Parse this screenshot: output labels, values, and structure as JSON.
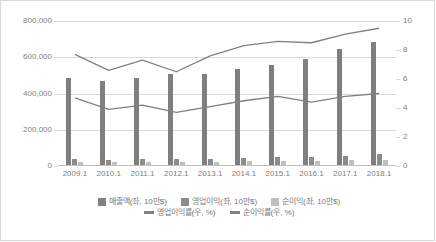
{
  "chart_data": {
    "type": "bar",
    "title": "",
    "subtitle": "",
    "xlabel": "",
    "ylabel": "",
    "grid": true,
    "legend_position": "bottom",
    "categories": [
      "2009.1",
      "2010.1",
      "2011.1",
      "2012.1",
      "2013.1",
      "2014.1",
      "2015.1",
      "2016.1",
      "2017.1",
      "2018.1"
    ],
    "axes": {
      "left": {
        "label": "",
        "min": 0,
        "max": 800000,
        "step": 200000,
        "ticks": [
          "0",
          "200,000",
          "400,000",
          "600,000",
          "800,000"
        ],
        "tick_values": [
          0,
          200000,
          400000,
          600000,
          800000
        ]
      },
      "right": {
        "label": "",
        "min": 0,
        "max": 10,
        "step": 2,
        "ticks": [
          "0",
          "2",
          "4",
          "6",
          "8",
          "10"
        ],
        "tick_values": [
          0,
          2,
          4,
          6,
          8,
          10
        ]
      }
    },
    "series": [
      {
        "name": "매출액(좌, 10만$)",
        "type": "bar",
        "axis": "left",
        "color": "#7f7f7f",
        "values": [
          485000,
          470000,
          485000,
          505000,
          508000,
          537000,
          560000,
          590000,
          648000,
          685000
        ]
      },
      {
        "name": "영업이익(좌, 10만$)",
        "type": "bar",
        "axis": "left",
        "color": "#8c8c8c",
        "values": [
          38000,
          33000,
          38000,
          36000,
          38000,
          44000,
          52000,
          49000,
          58000,
          68000
        ]
      },
      {
        "name": "순이익(좌, 10만$)",
        "type": "bar",
        "axis": "left",
        "color": "#bfbfbf",
        "values": [
          23000,
          22000,
          23000,
          22000,
          24000,
          25000,
          29000,
          28000,
          31000,
          33000
        ]
      },
      {
        "name": "영업이익률(우, %)",
        "type": "line",
        "axis": "right",
        "color": "#808080",
        "values": [
          7.7,
          6.6,
          7.3,
          6.5,
          7.6,
          8.3,
          8.6,
          8.5,
          9.1,
          9.5
        ]
      },
      {
        "name": "순이익률(우, %)",
        "type": "line",
        "axis": "right",
        "color": "#808080",
        "values": [
          4.7,
          3.9,
          4.2,
          3.7,
          4.1,
          4.5,
          4.8,
          4.4,
          4.8,
          5.0
        ]
      }
    ]
  },
  "legend": {
    "row1": [
      {
        "label": "매출액(좌, 10만$)",
        "color": "#7f7f7f",
        "marker": "square"
      },
      {
        "label": "영업이익(좌, 10만$)",
        "color": "#8c8c8c",
        "marker": "square"
      },
      {
        "label": "순이익(좌, 10만$)",
        "color": "#bfbfbf",
        "marker": "square"
      }
    ],
    "row2": [
      {
        "label": "영업이익률(우, %)",
        "color": "#808080",
        "marker": "line"
      },
      {
        "label": "순이익률(우, %)",
        "color": "#808080",
        "marker": "line"
      }
    ]
  },
  "colors": {
    "sales_bar": "#7f7f7f",
    "operating_profit_bar": "#8c8c8c",
    "net_profit_bar": "#bfbfbf",
    "line": "#808080",
    "gridline": "#d9d9d9",
    "border": "#d9d9d9",
    "text": "#808080",
    "background": "#ffffff"
  }
}
